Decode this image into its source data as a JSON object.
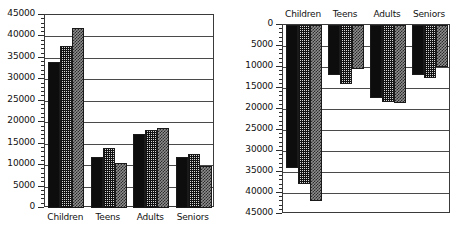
{
  "chart_data": [
    {
      "id": "left",
      "type": "bar",
      "title": "",
      "xlabel": "",
      "ylabel": "",
      "orientation": "upward",
      "axis_reversed": false,
      "grid": true,
      "legend": "none",
      "categories": [
        "Children",
        "Teens",
        "Adults",
        "Seniors"
      ],
      "ylim": [
        0,
        45000
      ],
      "ytick_labels": [
        "0",
        "5000",
        "10000",
        "15000",
        "20000",
        "25000",
        "30000",
        "35000",
        "40000",
        "45000"
      ],
      "ytick_values": [
        0,
        5000,
        10000,
        15000,
        20000,
        25000,
        30000,
        35000,
        40000,
        45000
      ],
      "minor_ticks_per_interval": 5,
      "series": [
        {
          "name": "series-1",
          "values": [
            34000,
            12000,
            17300,
            12000
          ]
        },
        {
          "name": "series-2",
          "values": [
            37800,
            14000,
            18300,
            12700
          ]
        },
        {
          "name": "series-3",
          "values": [
            42000,
            10500,
            18600,
            9900
          ]
        }
      ]
    },
    {
      "id": "right",
      "type": "bar",
      "title": "",
      "xlabel": "",
      "ylabel": "",
      "orientation": "downward",
      "axis_reversed": true,
      "grid": true,
      "legend": "none",
      "categories": [
        "Children",
        "Teens",
        "Adults",
        "Seniors"
      ],
      "ylim": [
        0,
        45000
      ],
      "ytick_labels": [
        "0",
        "5000",
        "10000",
        "15000",
        "20000",
        "25000",
        "30000",
        "35000",
        "40000",
        "45000"
      ],
      "ytick_values": [
        0,
        5000,
        10000,
        15000,
        20000,
        25000,
        30000,
        35000,
        40000,
        45000
      ],
      "minor_ticks_per_interval": 5,
      "series": [
        {
          "name": "series-1",
          "values": [
            34000,
            12000,
            17300,
            12000
          ]
        },
        {
          "name": "series-2",
          "values": [
            37800,
            14000,
            18300,
            12700
          ]
        },
        {
          "name": "series-3",
          "values": [
            42000,
            10500,
            18600,
            9900
          ]
        }
      ]
    }
  ]
}
